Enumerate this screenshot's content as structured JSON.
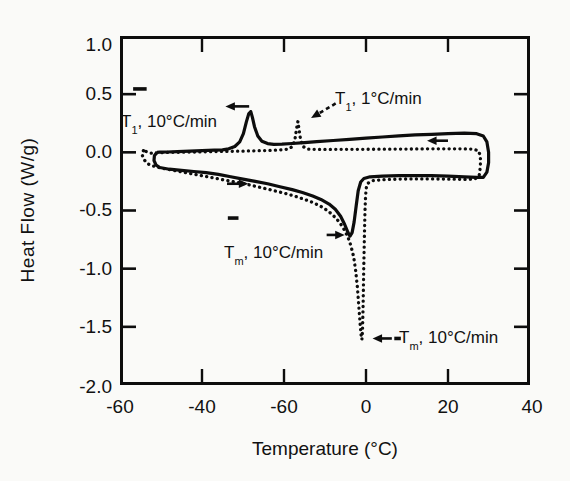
{
  "figure": {
    "xlabel": "Temperature (°C)",
    "ylabel": "Heat Flow (W/g)",
    "y_tick_labels": [
      "1.0",
      "0.5",
      "0.0",
      "-0.5",
      "-1.0",
      "-1.5",
      "-2.0"
    ],
    "x_tick_labels": [
      "-60",
      "-40",
      "-60",
      "0",
      "20",
      "40"
    ],
    "annotations": {
      "t1_fast": {
        "pre": "T",
        "sub": "1",
        "post": ", 10°C/min"
      },
      "t1_slow": {
        "pre": "T",
        "sub": "1",
        "post": ", 1°C/min"
      },
      "tm_mid": {
        "pre": "T",
        "sub": "m",
        "post": ", 10°C/min"
      },
      "tm_bottom": {
        "pre": "T",
        "sub": "m",
        "post": ", 10°C/min"
      }
    },
    "line_color": "#0d0d0d",
    "background": "#fafaf8"
  },
  "chart_data": {
    "type": "line",
    "title": "",
    "xlabel": "Temperature (°C)",
    "ylabel": "Heat Flow (W/g)",
    "xlim": [
      -60,
      40
    ],
    "ylim": [
      -2.0,
      1.0
    ],
    "grid": false,
    "legend": "none",
    "x_tick_values": [
      -60,
      -40,
      -20,
      0,
      20,
      40
    ],
    "x_tick_labels_as_printed": [
      "-60",
      "-40",
      "-60",
      "0",
      "20",
      "40"
    ],
    "y_tick_values": [
      1.0,
      0.5,
      0.0,
      -0.5,
      -1.0,
      -1.5,
      -2.0
    ],
    "key_features": {
      "T1_peak_10C_min": {
        "temp_C": -28,
        "heat_flow_W_g": 0.35
      },
      "T1_peak_1C_min": {
        "temp_C": -16.6,
        "heat_flow_W_g": 0.27
      },
      "Tm_min_solid_curve": {
        "temp_C": -4,
        "heat_flow_W_g": -0.72
      },
      "Tm_min_dotted_curve": {
        "temp_C": -1,
        "heat_flow_W_g": -1.61
      }
    },
    "series": [
      {
        "name": "heat-cool cycle, 10°C/min",
        "line_style": "solid",
        "points": [
          [
            -51.0,
            0.0
          ],
          [
            -51.6,
            -0.03
          ],
          [
            -51.7,
            -0.07
          ],
          [
            -51.2,
            -0.11
          ],
          [
            -50.3,
            -0.13
          ],
          [
            -48,
            -0.145
          ],
          [
            -45,
            -0.155
          ],
          [
            -42,
            -0.165
          ],
          [
            -39,
            -0.175
          ],
          [
            -36,
            -0.19
          ],
          [
            -33,
            -0.21
          ],
          [
            -30,
            -0.23
          ],
          [
            -27,
            -0.25
          ],
          [
            -24,
            -0.27
          ],
          [
            -21,
            -0.295
          ],
          [
            -18,
            -0.32
          ],
          [
            -15.5,
            -0.345
          ],
          [
            -13,
            -0.375
          ],
          [
            -11,
            -0.405
          ],
          [
            -9,
            -0.445
          ],
          [
            -7.5,
            -0.49
          ],
          [
            -6.2,
            -0.55
          ],
          [
            -5.2,
            -0.62
          ],
          [
            -4.4,
            -0.69
          ],
          [
            -3.9,
            -0.72
          ],
          [
            -3.4,
            -0.69
          ],
          [
            -2.9,
            -0.6
          ],
          [
            -2.4,
            -0.46
          ],
          [
            -1.9,
            -0.33
          ],
          [
            -1.3,
            -0.255
          ],
          [
            -0.5,
            -0.225
          ],
          [
            1,
            -0.21
          ],
          [
            4,
            -0.205
          ],
          [
            8,
            -0.2
          ],
          [
            12,
            -0.2
          ],
          [
            16,
            -0.2
          ],
          [
            20,
            -0.205
          ],
          [
            24,
            -0.21
          ],
          [
            27,
            -0.215
          ],
          [
            28.6,
            -0.215
          ],
          [
            29.5,
            -0.17
          ],
          [
            29.9,
            -0.09
          ],
          [
            29.9,
            0.0
          ],
          [
            29.5,
            0.09
          ],
          [
            28.6,
            0.14
          ],
          [
            27,
            0.16
          ],
          [
            24,
            0.165
          ],
          [
            20,
            0.16
          ],
          [
            16,
            0.155
          ],
          [
            12,
            0.15
          ],
          [
            8,
            0.142
          ],
          [
            4,
            0.132
          ],
          [
            0,
            0.122
          ],
          [
            -4,
            0.112
          ],
          [
            -8,
            0.102
          ],
          [
            -12,
            0.092
          ],
          [
            -15,
            0.084
          ],
          [
            -18,
            0.076
          ],
          [
            -20.5,
            0.07
          ],
          [
            -22.5,
            0.068
          ],
          [
            -24,
            0.075
          ],
          [
            -25.4,
            0.095
          ],
          [
            -26.4,
            0.14
          ],
          [
            -27.2,
            0.22
          ],
          [
            -27.7,
            0.3
          ],
          [
            -28.1,
            0.35
          ],
          [
            -28.6,
            0.33
          ],
          [
            -29.2,
            0.26
          ],
          [
            -29.9,
            0.16
          ],
          [
            -30.8,
            0.09
          ],
          [
            -32,
            0.05
          ],
          [
            -33.5,
            0.03
          ],
          [
            -35,
            0.022
          ],
          [
            -37,
            0.018
          ],
          [
            -40,
            0.014
          ],
          [
            -43,
            0.01
          ],
          [
            -46,
            0.006
          ],
          [
            -48.5,
            0.003
          ],
          [
            -50.3,
            0.001
          ],
          [
            -51.0,
            0.0
          ]
        ]
      },
      {
        "name": "heat-cool cycle, 1°C/min",
        "line_style": "dotted",
        "points": [
          [
            -54.3,
            0.015
          ],
          [
            -54.6,
            -0.02
          ],
          [
            -54.2,
            -0.06
          ],
          [
            -53.4,
            -0.095
          ],
          [
            -52.2,
            -0.115
          ],
          [
            -50,
            -0.135
          ],
          [
            -47,
            -0.155
          ],
          [
            -44,
            -0.175
          ],
          [
            -41,
            -0.195
          ],
          [
            -38,
            -0.215
          ],
          [
            -35,
            -0.235
          ],
          [
            -32,
            -0.255
          ],
          [
            -29,
            -0.275
          ],
          [
            -26,
            -0.3
          ],
          [
            -23,
            -0.325
          ],
          [
            -20,
            -0.35
          ],
          [
            -17.5,
            -0.375
          ],
          [
            -15,
            -0.405
          ],
          [
            -13,
            -0.43
          ],
          [
            -11,
            -0.465
          ],
          [
            -9.2,
            -0.505
          ],
          [
            -7.8,
            -0.55
          ],
          [
            -6.5,
            -0.6
          ],
          [
            -5.4,
            -0.66
          ],
          [
            -4.5,
            -0.72
          ],
          [
            -3.7,
            -0.8
          ],
          [
            -3.0,
            -0.9
          ],
          [
            -2.5,
            -1.02
          ],
          [
            -2.1,
            -1.16
          ],
          [
            -1.75,
            -1.32
          ],
          [
            -1.45,
            -1.47
          ],
          [
            -1.2,
            -1.57
          ],
          [
            -1.0,
            -1.61
          ],
          [
            -0.85,
            -1.53
          ],
          [
            -0.7,
            -1.32
          ],
          [
            -0.55,
            -1.02
          ],
          [
            -0.4,
            -0.72
          ],
          [
            -0.25,
            -0.5
          ],
          [
            -0.1,
            -0.37
          ],
          [
            0.1,
            -0.3
          ],
          [
            0.5,
            -0.265
          ],
          [
            1.5,
            -0.245
          ],
          [
            4,
            -0.235
          ],
          [
            8,
            -0.23
          ],
          [
            12,
            -0.228
          ],
          [
            16,
            -0.228
          ],
          [
            20,
            -0.23
          ],
          [
            24,
            -0.233
          ],
          [
            26.5,
            -0.23
          ],
          [
            27.6,
            -0.2
          ],
          [
            27.9,
            -0.12
          ],
          [
            27.9,
            -0.03
          ],
          [
            27.4,
            0.015
          ],
          [
            26,
            0.028
          ],
          [
            23,
            0.03
          ],
          [
            19,
            0.03
          ],
          [
            15,
            0.03
          ],
          [
            11,
            0.029
          ],
          [
            7,
            0.028
          ],
          [
            3,
            0.027
          ],
          [
            -1,
            0.026
          ],
          [
            -5,
            0.026
          ],
          [
            -9,
            0.025
          ],
          [
            -12,
            0.025
          ],
          [
            -14.2,
            0.028
          ],
          [
            -15.4,
            0.05
          ],
          [
            -16.0,
            0.12
          ],
          [
            -16.4,
            0.21
          ],
          [
            -16.6,
            0.265
          ],
          [
            -16.9,
            0.21
          ],
          [
            -17.3,
            0.12
          ],
          [
            -17.9,
            0.05
          ],
          [
            -19,
            0.028
          ],
          [
            -21,
            0.02
          ],
          [
            -24,
            0.016
          ],
          [
            -27,
            0.013
          ],
          [
            -30,
            0.011
          ],
          [
            -33,
            0.009
          ],
          [
            -36,
            0.007
          ],
          [
            -39,
            0.005
          ],
          [
            -42,
            0.003
          ],
          [
            -45,
            0.001
          ],
          [
            -48,
            -0.001
          ],
          [
            -50.5,
            -0.004
          ],
          [
            -52.5,
            -0.007
          ],
          [
            -54.3,
            0.015
          ]
        ]
      }
    ],
    "markers": [
      {
        "id": "cooling-arrow-left",
        "type": "arrow",
        "from": [
          -28.5,
          0.395
        ],
        "to": [
          -34.3,
          0.395
        ]
      },
      {
        "id": "cooling-arrow-right",
        "type": "arrow",
        "from": [
          20.0,
          0.1
        ],
        "to": [
          14.9,
          0.1
        ]
      },
      {
        "id": "heating-arrow-left",
        "type": "arrow",
        "from": [
          -33.9,
          -0.27
        ],
        "to": [
          -28.7,
          -0.27
        ]
      },
      {
        "id": "tm-solid-arrow",
        "type": "arrow",
        "from": [
          -9.6,
          -0.71
        ],
        "to": [
          -5.2,
          -0.71
        ]
      },
      {
        "id": "tm-dotted-arrow",
        "type": "arrow",
        "from": [
          6.3,
          -1.6
        ],
        "to": [
          1.6,
          -1.6
        ]
      },
      {
        "id": "tm-dotted-lead-dash",
        "type": "dash",
        "from": [
          6.9,
          -1.6
        ],
        "to": [
          8.5,
          -1.6
        ]
      },
      {
        "id": "t1-dotted-arrow",
        "type": "dashed-arrow",
        "from": [
          -7.4,
          0.42
        ],
        "to": [
          -13.4,
          0.295
        ]
      },
      {
        "id": "upper-dash-marker",
        "type": "dash",
        "from": [
          -56.8,
          0.545
        ],
        "to": [
          -53.5,
          0.545
        ]
      },
      {
        "id": "mid-dash-marker",
        "type": "dash",
        "from": [
          -33.7,
          -0.565
        ],
        "to": [
          -31.1,
          -0.565
        ]
      }
    ]
  }
}
